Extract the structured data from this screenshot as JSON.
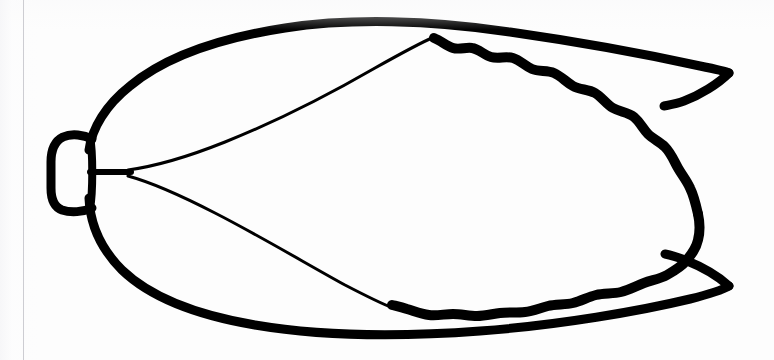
{
  "figure": {
    "view": "dorsal-flat",
    "style": "black-ink-line-art",
    "background_color": "#fdfdfd",
    "ink_color": "#000000",
    "canvas": {
      "width": 774,
      "height": 360
    },
    "scan_artifact": {
      "type": "vertical-scan-line",
      "x": 23,
      "color": "#cdcdd2"
    },
    "parts": [
      {
        "id": "wing-base-stub",
        "label": "Wing base articulation stub",
        "stroke_width": 9,
        "description": "Small open rectangle at the far left where the wing attaches to the thorax",
        "bbox": [
          48,
          135,
          44,
          76
        ]
      },
      {
        "id": "leading-edge",
        "label": "Costal (leading) margin",
        "stroke_width": 9,
        "description": "Thick upper outline sweeping from the base up and right to the upper wing tip"
      },
      {
        "id": "trailing-edge",
        "label": "Anal (trailing) margin",
        "stroke_width": 9,
        "description": "Thick lower outline sweeping from the base down and right to the lower wing tip"
      },
      {
        "id": "membrane-outline",
        "label": "Inner membrane with scalloped margin",
        "stroke_width": 10,
        "description": "Bumpy wavy-edged inner contour occupying the right two thirds of the wing"
      },
      {
        "id": "vein-upper",
        "label": "Upper longitudinal vein",
        "stroke_width": 3,
        "description": "Thin vein from the basal node to the upper margin near the membrane start"
      },
      {
        "id": "vein-lower",
        "label": "Lower longitudinal vein",
        "stroke_width": 3,
        "description": "Thin vein from the basal node to the lower margin near the membrane start"
      },
      {
        "id": "basal-node",
        "label": "Basal vein node",
        "description": "Junction at the wing base where the two longitudinal veins diverge",
        "point": [
          130,
          172
        ]
      },
      {
        "id": "tip-upper",
        "label": "Upper wing tip",
        "point": [
          729,
          72
        ]
      },
      {
        "id": "tip-lower",
        "label": "Lower wing tip",
        "point": [
          729,
          285
        ]
      }
    ]
  }
}
